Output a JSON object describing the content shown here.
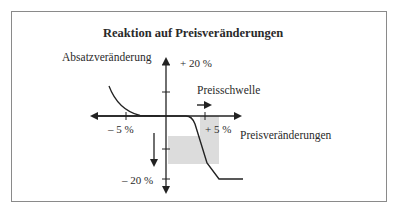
{
  "diagram": {
    "title": "Reaktion auf Preisveränderungen",
    "y_axis_label": "Absatzveränderung",
    "x_axis_label": "Preisveränderungen",
    "threshold_label": "Preisschwelle",
    "tick_labels": {
      "y_top": "+ 20 %",
      "y_bottom": "– 20 %",
      "x_left": "– 5 %",
      "x_right": "+ 5 %"
    },
    "colors": {
      "line": "#222222",
      "frame": "#8a8a8a",
      "highlight": "#dcdcdc",
      "text": "#2a2a2a"
    }
  }
}
